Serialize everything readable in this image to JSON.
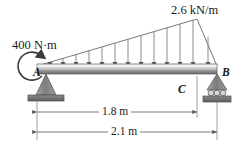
{
  "figure": {
    "type": "beam-free-body-diagram",
    "colors": {
      "line": "#58585a",
      "beam_light": "#f2f2f2",
      "beam_dark": "#6e6e70",
      "support_fill": "#8a8a8c",
      "ground_fill": "#6f6f71",
      "text": "#1a1a1a"
    },
    "labels": {
      "load_intensity": "2.6 kN/m",
      "applied_moment": "400 N·m",
      "point_a": "A",
      "point_b": "B",
      "point_c": "C",
      "dim_ac": "1.8 m",
      "dim_ab": "2.1 m"
    },
    "beam": {
      "left_x": 37,
      "right_x": 217,
      "top_y": 64,
      "bottom_y": 74
    },
    "distributed_load": {
      "shape": "triangular",
      "start_x": 37,
      "peak_x": 197,
      "end_x": 217,
      "peak_value": "2.6 kN/m",
      "start_value": "0",
      "end_value": "0",
      "arrow_count": 13
    },
    "supports": {
      "a": "pin",
      "b": "roller"
    },
    "dimensions": [
      {
        "name": "dim_ac",
        "label": "1.8 m",
        "from": "A",
        "to": "C",
        "y": 112
      },
      {
        "name": "dim_ab",
        "label": "2.1 m",
        "from": "A",
        "to": "B",
        "y": 132
      }
    ]
  }
}
